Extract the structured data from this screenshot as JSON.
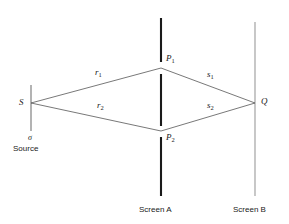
{
  "figure": {
    "type": "optics-ray-diagram",
    "background_color": "#ffffff",
    "line_color": "#555555",
    "screen_a_color": "#1a1a1a",
    "screen_b_color": "#9a9a9a",
    "source_slit_color": "#8a8a8a",
    "text_color": "#1a1a1a"
  },
  "labels": {
    "source_point": "S",
    "source_slit_symbol": "σ",
    "source_caption": "Source",
    "slit_top": "P",
    "slit_top_sub": "1",
    "slit_bottom": "P",
    "slit_bottom_sub": "2",
    "observation_point": "Q",
    "ray_r1": "r",
    "ray_r1_sub": "1",
    "ray_r2": "r",
    "ray_r2_sub": "2",
    "ray_s1": "s",
    "ray_s1_sub": "1",
    "ray_s2": "s",
    "ray_s2_sub": "2",
    "screen_a_caption": "Screen A",
    "screen_b_caption": "Screen B"
  },
  "geometry": {
    "source_point": {
      "x": 31,
      "y": 103
    },
    "source_slit": {
      "x": 31,
      "y_top": 85,
      "y_bottom": 131
    },
    "slit_top_point": {
      "x": 161,
      "y": 68
    },
    "slit_bottom_point": {
      "x": 161,
      "y": 131
    },
    "observation_point": {
      "x": 255,
      "y": 103
    },
    "screen_a": {
      "x": 161,
      "y_top": 18,
      "y_bottom": 196,
      "gap_top": [
        62,
        74
      ],
      "gap_bottom": [
        126,
        137
      ]
    },
    "screen_b": {
      "x": 255,
      "y_top": 22,
      "y_bottom": 196
    },
    "rays": [
      {
        "name": "r1",
        "from": [
          31,
          103
        ],
        "to": [
          161,
          68
        ]
      },
      {
        "name": "r2",
        "from": [
          31,
          103
        ],
        "to": [
          161,
          131
        ]
      },
      {
        "name": "s1",
        "from": [
          161,
          68
        ],
        "to": [
          255,
          103
        ]
      },
      {
        "name": "s2",
        "from": [
          161,
          131
        ],
        "to": [
          255,
          103
        ]
      }
    ]
  }
}
